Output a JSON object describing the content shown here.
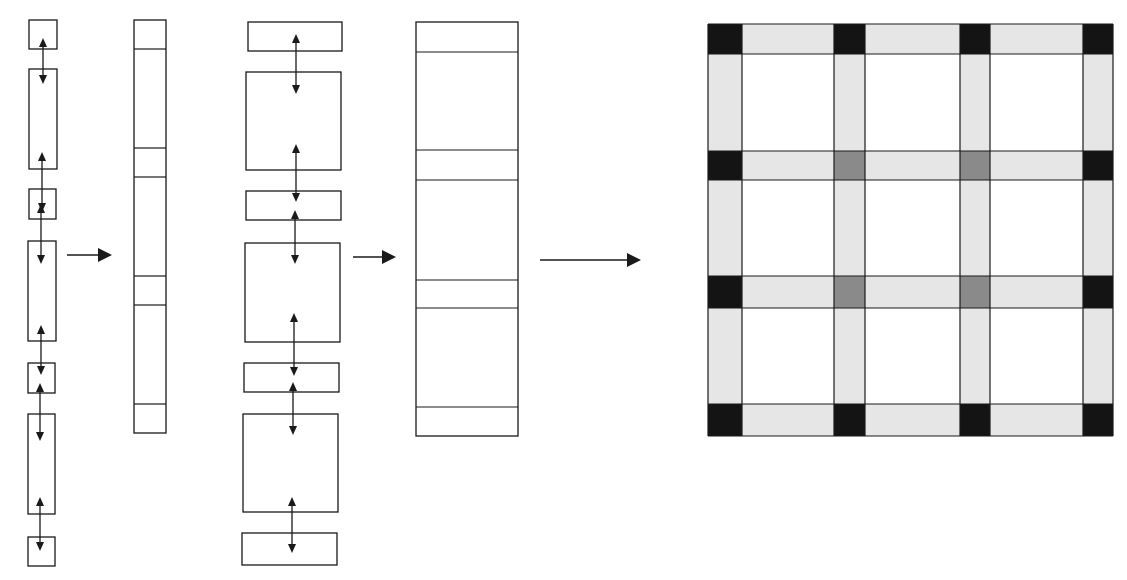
{
  "figure": {
    "colors": {
      "stroke": "#1a1a1a",
      "band_fill": "#e6e6e6",
      "corner_fill": "#141414",
      "interior_junction_fill": "#8a8a8a",
      "background": "#ffffff"
    },
    "stage1": {
      "boxes": [
        {
          "x": 29,
          "y": 20,
          "w": 28,
          "h": 29
        },
        {
          "x": 29,
          "y": 69,
          "w": 28,
          "h": 100
        },
        {
          "x": 29,
          "y": 189,
          "w": 27,
          "h": 30
        },
        {
          "x": 28,
          "y": 241,
          "w": 28,
          "h": 100
        },
        {
          "x": 28,
          "y": 363,
          "w": 27,
          "h": 30
        },
        {
          "x": 28,
          "y": 414,
          "w": 27,
          "h": 100
        },
        {
          "x": 28,
          "y": 537,
          "w": 27,
          "h": 29
        }
      ],
      "connectors": [
        {
          "x": 43,
          "y1": 38,
          "y2": 84
        },
        {
          "x": 42,
          "y1": 152,
          "y2": 212
        },
        {
          "x": 41,
          "y1": 204,
          "y2": 264
        },
        {
          "x": 41,
          "y1": 325,
          "y2": 375
        },
        {
          "x": 40,
          "y1": 383,
          "y2": 441
        },
        {
          "x": 40,
          "y1": 497,
          "y2": 551
        }
      ]
    },
    "stage2": {
      "strip": {
        "x": 134,
        "y": 20,
        "w": 32,
        "h": 413
      },
      "dividers": [
        49,
        148,
        177,
        276,
        305,
        404
      ]
    },
    "stage3": {
      "boxes": [
        {
          "x": 248,
          "y": 22,
          "w": 94,
          "h": 29
        },
        {
          "x": 246,
          "y": 72,
          "w": 95,
          "h": 98
        },
        {
          "x": 246,
          "y": 191,
          "w": 95,
          "h": 29
        },
        {
          "x": 245,
          "y": 243,
          "w": 95,
          "h": 99
        },
        {
          "x": 244,
          "y": 363,
          "w": 95,
          "h": 29
        },
        {
          "x": 243,
          "y": 414,
          "w": 95,
          "h": 98
        },
        {
          "x": 242,
          "y": 533,
          "w": 95,
          "h": 32
        }
      ],
      "connectors": [
        {
          "x": 296,
          "y1": 34,
          "y2": 94
        },
        {
          "x": 296,
          "y1": 144,
          "y2": 202
        },
        {
          "x": 295,
          "y1": 210,
          "y2": 264
        },
        {
          "x": 294,
          "y1": 313,
          "y2": 376
        },
        {
          "x": 293,
          "y1": 382,
          "y2": 435
        },
        {
          "x": 292,
          "y1": 497,
          "y2": 553
        }
      ]
    },
    "stage4": {
      "strip": {
        "x": 416,
        "y": 22,
        "w": 102,
        "h": 414
      },
      "dividers": [
        52,
        150,
        180,
        280,
        308,
        407
      ]
    },
    "transition_arrows": [
      {
        "x1": 67,
        "x2": 112,
        "y": 255
      },
      {
        "x1": 353,
        "x2": 396,
        "y": 257
      },
      {
        "x1": 540,
        "x2": 641,
        "y": 260
      }
    ],
    "grid": {
      "x": 708,
      "y": 24,
      "w": 405,
      "h": 412,
      "band_cols": [
        [
          708,
          742
        ],
        [
          834,
          865
        ],
        [
          960,
          990
        ],
        [
          1083,
          1113
        ]
      ],
      "band_rows": [
        [
          24,
          54
        ],
        [
          151,
          180
        ],
        [
          276,
          308
        ],
        [
          404,
          436
        ]
      ],
      "junctions": [
        [
          "dark",
          "dark",
          "dark",
          "dark"
        ],
        [
          "dark",
          "mid",
          "mid",
          "dark"
        ],
        [
          "dark",
          "mid",
          "mid",
          "dark"
        ],
        [
          "dark",
          "dark",
          "dark",
          "dark"
        ]
      ]
    }
  }
}
